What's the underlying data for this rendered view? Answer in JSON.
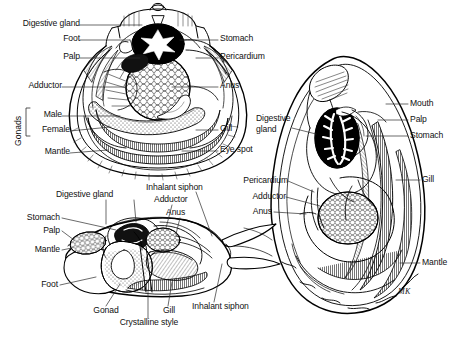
{
  "figure": {
    "background_color": "#ffffff",
    "ink_color": "#000000",
    "signature": "MK"
  },
  "panels": [
    {
      "id": "scallop",
      "name": "scallop-panel",
      "labels_left": [
        {
          "text": "Digestive gland",
          "x": 8,
          "y": 22
        },
        {
          "text": "Foot",
          "x": 56,
          "y": 37
        },
        {
          "text": "Palp",
          "x": 56,
          "y": 55
        },
        {
          "text": "Adductor",
          "x": 8,
          "y": 84
        },
        {
          "text": "Male",
          "x": 34,
          "y": 113
        },
        {
          "text": "Female",
          "x": 34,
          "y": 128
        },
        {
          "text": "Mantle",
          "x": 34,
          "y": 150
        }
      ],
      "bracket_label": {
        "text": "Gonads",
        "x": 10,
        "y": 148
      },
      "labels_right": [
        {
          "text": "Stomach",
          "x": 222,
          "y": 37
        },
        {
          "text": "Pericardium",
          "x": 222,
          "y": 55
        },
        {
          "text": "Anus",
          "x": 222,
          "y": 84
        },
        {
          "text": "Gill",
          "x": 222,
          "y": 127
        },
        {
          "text": "Eye spot",
          "x": 222,
          "y": 148
        }
      ]
    },
    {
      "id": "clam",
      "name": "clam-panel",
      "labels": [
        {
          "text": "Digestive gland",
          "x": 58,
          "y": 190,
          "align": "left"
        },
        {
          "text": "Inhalant siphon",
          "x": 148,
          "y": 183,
          "align": "left"
        },
        {
          "text": "Adductor",
          "x": 155,
          "y": 196,
          "align": "left"
        },
        {
          "text": "Anus",
          "x": 166,
          "y": 209,
          "align": "left"
        },
        {
          "text": "Stomach",
          "x": 29,
          "y": 215,
          "align": "left"
        },
        {
          "text": "Palp",
          "x": 42,
          "y": 228,
          "align": "left"
        },
        {
          "text": "Mantle",
          "x": 28,
          "y": 247,
          "align": "left"
        },
        {
          "text": "Foot",
          "x": 36,
          "y": 282,
          "align": "left"
        },
        {
          "text": "Gonad",
          "x": 92,
          "y": 310,
          "align": "left"
        },
        {
          "text": "Gill",
          "x": 160,
          "y": 310,
          "align": "left"
        },
        {
          "text": "Crystalline style",
          "x": 108,
          "y": 322,
          "align": "left"
        },
        {
          "text": "Inhalant siphon",
          "x": 196,
          "y": 305,
          "align": "left"
        }
      ]
    },
    {
      "id": "oyster",
      "name": "oyster-panel",
      "labels_left": [
        {
          "text": "Digestive",
          "x": 258,
          "y": 118
        },
        {
          "text": "gland",
          "x": 258,
          "y": 129
        },
        {
          "text": "Pericardium",
          "x": 236,
          "y": 178
        },
        {
          "text": "Adductor",
          "x": 248,
          "y": 194
        },
        {
          "text": "Anus",
          "x": 250,
          "y": 209
        }
      ],
      "labels_right": [
        {
          "text": "Mouth",
          "x": 412,
          "y": 101
        },
        {
          "text": "Palp",
          "x": 412,
          "y": 117
        },
        {
          "text": "Stomach",
          "x": 412,
          "y": 133
        },
        {
          "text": "Gill",
          "x": 424,
          "y": 177
        },
        {
          "text": "Mantle",
          "x": 424,
          "y": 260
        }
      ]
    }
  ],
  "all_label_terms": [
    "Digestive gland",
    "Foot",
    "Palp",
    "Adductor",
    "Gonads",
    "Male",
    "Female",
    "Mantle",
    "Stomach",
    "Pericardium",
    "Anus",
    "Gill",
    "Eye spot",
    "Inhalant siphon",
    "Gonad",
    "Crystalline style",
    "Mouth"
  ]
}
